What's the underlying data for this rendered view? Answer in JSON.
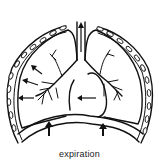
{
  "diagram": {
    "caption": "expiration",
    "parts": [
      "rib-cage",
      "trachea",
      "left-lung",
      "right-lung",
      "bronchial-tree",
      "heart",
      "diaphragm"
    ],
    "arrows": {
      "lung_deflation": 3,
      "heart_direction": "left",
      "diaphragm_direction": "up",
      "diaphragm_count": 2,
      "trachea_air_direction": "up"
    },
    "colors": {
      "line": "#111111",
      "background": "#ffffff"
    }
  }
}
